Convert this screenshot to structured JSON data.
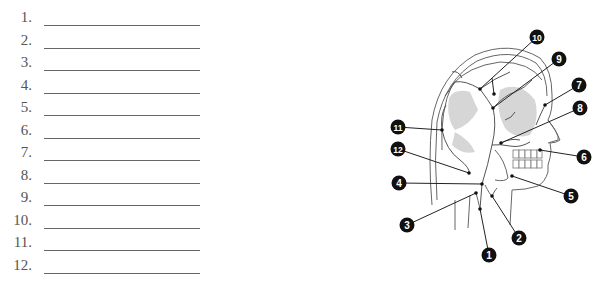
{
  "worksheet": {
    "blanks": [
      {
        "number": "1."
      },
      {
        "number": "2."
      },
      {
        "number": "3."
      },
      {
        "number": "4."
      },
      {
        "number": "5."
      },
      {
        "number": "6."
      },
      {
        "number": "7."
      },
      {
        "number": "8."
      },
      {
        "number": "9."
      },
      {
        "number": "10."
      },
      {
        "number": "11."
      },
      {
        "number": "12."
      }
    ]
  },
  "diagram": {
    "callouts": [
      {
        "id": "1",
        "label": "1",
        "badge": [
          489,
          255
        ],
        "target": [
          480,
          209
        ]
      },
      {
        "id": "2",
        "label": "2",
        "badge": [
          519,
          238
        ],
        "target": [
          492,
          196
        ]
      },
      {
        "id": "3",
        "label": "3",
        "badge": [
          407,
          225
        ],
        "target": [
          476,
          193
        ]
      },
      {
        "id": "4",
        "label": "4",
        "badge": [
          399,
          183
        ],
        "target": [
          482,
          184
        ]
      },
      {
        "id": "5",
        "label": "5",
        "badge": [
          571,
          196
        ],
        "target": [
          512,
          176
        ]
      },
      {
        "id": "6",
        "label": "6",
        "badge": [
          584,
          157
        ],
        "target": [
          540,
          150
        ]
      },
      {
        "id": "7",
        "label": "7",
        "badge": [
          579,
          85
        ],
        "target": [
          545,
          105
        ]
      },
      {
        "id": "8",
        "label": "8",
        "badge": [
          580,
          108
        ],
        "target": [
          501,
          143
        ]
      },
      {
        "id": "9",
        "label": "9",
        "badge": [
          559,
          59
        ],
        "target": [
          493,
          108
        ]
      },
      {
        "id": "10",
        "label": "10",
        "badge": [
          537,
          37
        ],
        "target": [
          480,
          89
        ]
      },
      {
        "id": "11",
        "label": "11",
        "badge": [
          398,
          127
        ],
        "target": [
          442,
          130
        ]
      },
      {
        "id": "12",
        "label": "12",
        "badge": [
          398,
          149
        ],
        "target": [
          469,
          173
        ]
      }
    ]
  }
}
